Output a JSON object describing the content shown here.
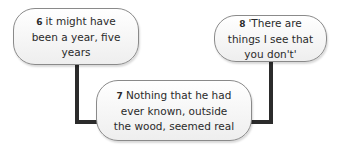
{
  "nodes": [
    {
      "number": "6",
      "text": "it might have been a year, five years"
    },
    {
      "number": "7",
      "text": "Nothing that he had ever known, outside the wood, seemed real"
    },
    {
      "number": "8",
      "text": "'There are things I see that you don't'"
    }
  ],
  "colors": {
    "line": "#2b2b2b",
    "border": "#8a8a8a",
    "fill": "#f4f4f4"
  }
}
